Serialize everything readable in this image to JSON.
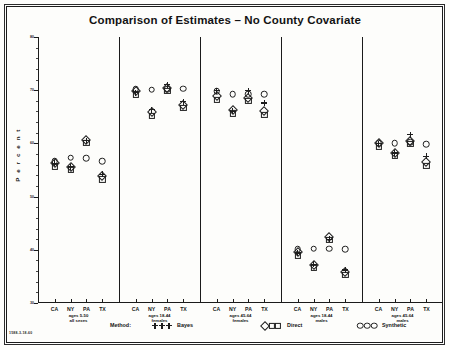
{
  "title": "Comparison of Estimates  –  No County Covariate",
  "ylabel": "P e r c e n t",
  "corner_note": "1588-3-18-60",
  "legend": {
    "method_label": "Method:",
    "items": [
      {
        "label": "Bayes",
        "glyph": "plus"
      },
      {
        "label": "Direct",
        "glyph": "diamond-square"
      },
      {
        "label": "Synthetic",
        "glyph": "circle"
      }
    ]
  },
  "chart_data": {
    "type": "scatter",
    "title": "Comparison of Estimates  –  No County Covariate",
    "xlabel": "",
    "ylabel": "Percent",
    "ylim": [
      30,
      80
    ],
    "yticks": [
      30,
      40,
      50,
      60,
      70,
      80
    ],
    "ytick_labels": [
      "30",
      "40",
      "50",
      "60",
      "70",
      "80"
    ],
    "grid": false,
    "legend_position": "below-axis",
    "panel_label_key": "Panels separated by vertical rules; states repeat within each panel",
    "states": [
      "CA",
      "NY",
      "PA",
      "TX"
    ],
    "methods": [
      "Bayes",
      "Direct",
      "Synthetic"
    ],
    "panels": [
      {
        "label": "ages 5-50\nall sexes",
        "label_line1": "ages 5-50",
        "label_line2": "all sexes",
        "points": [
          {
            "state": "CA",
            "Bayes": 56.3,
            "Direct": 56.0,
            "Synthetic": 56.6
          },
          {
            "state": "NY",
            "Bayes": 55.6,
            "Direct": 55.4,
            "Synthetic": 57.3
          },
          {
            "state": "PA",
            "Bayes": 60.5,
            "Direct": 60.4,
            "Synthetic": 57.2
          },
          {
            "state": "TX",
            "Bayes": 54.2,
            "Direct": 53.6,
            "Synthetic": 56.7
          }
        ]
      },
      {
        "label": "ages 18-44\nfemales",
        "label_line1": "ages 18-44",
        "label_line2": "females",
        "points": [
          {
            "state": "CA",
            "Bayes": 69.5,
            "Direct": 69.6,
            "Synthetic": 70.2
          },
          {
            "state": "NY",
            "Bayes": 66.3,
            "Direct": 65.6,
            "Synthetic": 70.1
          },
          {
            "state": "PA",
            "Bayes": 71.0,
            "Direct": 70.2,
            "Synthetic": 70.2
          },
          {
            "state": "TX",
            "Bayes": 67.8,
            "Direct": 67.0,
            "Synthetic": 70.3
          }
        ]
      },
      {
        "label": "ages 45-64\nfemales",
        "label_line1": "ages 45-64",
        "label_line2": "females",
        "points": [
          {
            "state": "CA",
            "Bayes": 69.9,
            "Direct": 68.6,
            "Synthetic": 69.8
          },
          {
            "state": "NY",
            "Bayes": 66.0,
            "Direct": 66.0,
            "Synthetic": 69.2
          },
          {
            "state": "PA",
            "Bayes": 69.9,
            "Direct": 68.3,
            "Synthetic": 69.3
          },
          {
            "state": "TX",
            "Bayes": 67.6,
            "Direct": 65.8,
            "Synthetic": 69.2
          }
        ]
      },
      {
        "label": "ages 18-44\nmales",
        "label_line1": "ages 18-44",
        "label_line2": "males",
        "points": [
          {
            "state": "CA",
            "Bayes": 39.4,
            "Direct": 39.3,
            "Synthetic": 40.1
          },
          {
            "state": "NY",
            "Bayes": 37.3,
            "Direct": 36.9,
            "Synthetic": 40.2
          },
          {
            "state": "PA",
            "Bayes": 42.0,
            "Direct": 42.2,
            "Synthetic": 40.2
          },
          {
            "state": "TX",
            "Bayes": 36.2,
            "Direct": 35.6,
            "Synthetic": 40.1
          }
        ]
      },
      {
        "label": "ages 45-64\nmales",
        "label_line1": "ages 45-64",
        "label_line2": "males",
        "points": [
          {
            "state": "CA",
            "Bayes": 59.9,
            "Direct": 59.8,
            "Synthetic": 60.0
          },
          {
            "state": "NY",
            "Bayes": 58.2,
            "Direct": 58.0,
            "Synthetic": 60.0
          },
          {
            "state": "PA",
            "Bayes": 61.6,
            "Direct": 60.3,
            "Synthetic": 60.2
          },
          {
            "state": "TX",
            "Bayes": 57.6,
            "Direct": 56.2,
            "Synthetic": 59.8
          }
        ]
      }
    ]
  }
}
